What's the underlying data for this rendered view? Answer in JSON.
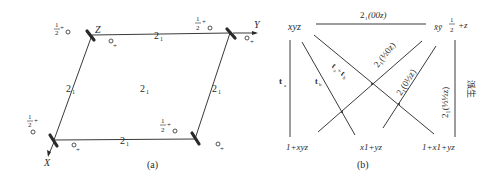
{
  "panel_a": {
    "caption": "(a)",
    "axis_labels": {
      "x": "X",
      "y": "Y",
      "z": "Z"
    },
    "screw_axis_label": "2",
    "screw_axis_sub": "1",
    "half_label_num": "1",
    "half_label_den": "2",
    "plus": "+",
    "circle": "o"
  },
  "panel_b": {
    "caption": "(b)",
    "top_left": "xyz",
    "top_right_prefix": "x̄ȳ",
    "top_right_half_num": "1",
    "top_right_half_den": "2",
    "top_right_suffix": "+z",
    "top_line_label": "2",
    "top_line_sub": "1",
    "top_line_arg": "(00z)",
    "bottom_labels": [
      "1+xyz",
      "x1+yz",
      "1+x1+yz"
    ],
    "vector_labels": {
      "ta": "t",
      "ta_sub": "a",
      "tb": "t",
      "tb_sub": "b",
      "tsum": "t",
      "tsum_sub1": "a",
      "tsum_plus": "+",
      "tsum2": "t",
      "tsum_sub2": "b"
    },
    "diag_label_1": "2₁(½0z)",
    "diag_label_2": "2₁(0½z)",
    "right_label": "2₁(½½z)",
    "side_text": "派生"
  }
}
